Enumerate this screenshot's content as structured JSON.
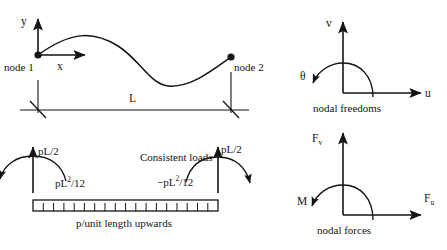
{
  "figure": {
    "stroke_color": "#141414",
    "background_color": "#ffffff"
  },
  "panel_beam": {
    "axis_y_label": "y",
    "axis_x_label": "x",
    "node1_label": "node 1",
    "node2_label": "node 2",
    "span_label": "L",
    "node1_point": [
      38,
      55
    ],
    "node2_point": [
      231,
      57
    ],
    "dimension_line_y": 110
  },
  "panel_loads": {
    "caption": "Consistent loads",
    "shear_left_label": "pL/2",
    "shear_right_label": "pL/2",
    "moment_left": {
      "base": "pL",
      "exponent": "2",
      "denominator": "/12",
      "sign": ""
    },
    "moment_right": {
      "base": "pL",
      "exponent": "2",
      "denominator": "/12",
      "sign": "−"
    },
    "moment_left_label": "pL2/12",
    "moment_right_label": "−pL2/12",
    "distributed_load_caption": "p/unit length upwards",
    "tick_count": 18
  },
  "panel_freedoms": {
    "caption": "nodal freedoms",
    "vertical_label": "v",
    "horizontal_label": "u",
    "rotation_label": "θ"
  },
  "panel_forces": {
    "caption": "nodal forces",
    "vertical_label": "F",
    "vertical_subscript": "v",
    "horizontal_label": "F",
    "horizontal_subscript": "u",
    "moment_label": "M"
  }
}
